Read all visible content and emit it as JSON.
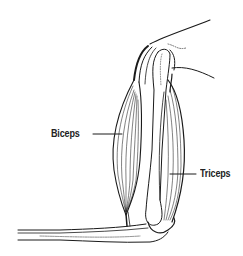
{
  "diagram": {
    "labels": {
      "biceps": "Biceps",
      "triceps": "Triceps"
    },
    "colors": {
      "ink": "#1a1a1a",
      "background": "#ffffff"
    },
    "parts": [
      "shoulder",
      "humerus-bone",
      "biceps-muscle",
      "triceps-muscle",
      "elbow",
      "forearm"
    ]
  }
}
